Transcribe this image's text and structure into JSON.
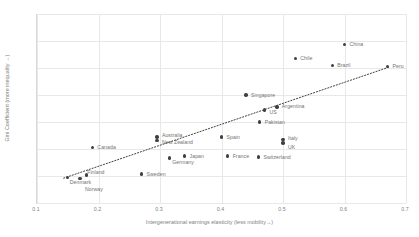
{
  "chart_data": {
    "type": "scatter",
    "title": "",
    "xlabel": "Intergenerational earnings elasticity (less mobility→)",
    "ylabel": "Gini Coefficient (more inequality →)",
    "xlim": [
      0.1,
      0.7
    ],
    "ylim": [
      0.2,
      0.55
    ],
    "xticks": [
      "0.1",
      "0.2",
      "0.3",
      "0.4",
      "0.5",
      "0.6",
      "0.7"
    ],
    "yticks": [
      "0.2",
      "0.25",
      "0.3",
      "0.35",
      "0.4",
      "0.45",
      "0.5",
      "0.55"
    ],
    "grid": true,
    "legend": "none",
    "point_color": "#404040",
    "trendline": {
      "style": "dotted",
      "color": "#404040",
      "x0": 0.145,
      "y0": 0.246,
      "x1": 0.675,
      "y1": 0.452
    },
    "points": [
      {
        "label": "Denmark",
        "x": 0.15,
        "y": 0.247,
        "label_dx": 2,
        "label_dy": 1
      },
      {
        "label": "Norway",
        "x": 0.17,
        "y": 0.245,
        "label_dx": 5,
        "label_dy": 7
      },
      {
        "label": "Finland",
        "x": 0.18,
        "y": 0.252,
        "label_dx": 1,
        "label_dy": -6
      },
      {
        "label": "Canada",
        "x": 0.19,
        "y": 0.303,
        "label_dx": 5,
        "label_dy": -3
      },
      {
        "label": "Sweden",
        "x": 0.27,
        "y": 0.254,
        "label_dx": 5,
        "label_dy": -3
      },
      {
        "label": "Australia",
        "x": 0.295,
        "y": 0.322,
        "label_dx": 5,
        "label_dy": -5
      },
      {
        "label": "New Zealand",
        "x": 0.295,
        "y": 0.316,
        "label_dx": 5,
        "label_dy": -1
      },
      {
        "label": "Germany",
        "x": 0.315,
        "y": 0.283,
        "label_dx": 3,
        "label_dy": 1
      },
      {
        "label": "Japan",
        "x": 0.34,
        "y": 0.287,
        "label_dx": 5,
        "label_dy": -3
      },
      {
        "label": "Spain",
        "x": 0.4,
        "y": 0.322,
        "label_dx": 5,
        "label_dy": -3
      },
      {
        "label": "France",
        "x": 0.41,
        "y": 0.287,
        "label_dx": 5,
        "label_dy": -3
      },
      {
        "label": "Switzerland",
        "x": 0.46,
        "y": 0.285,
        "label_dx": 5,
        "label_dy": -3
      },
      {
        "label": "Singapore",
        "x": 0.44,
        "y": 0.4,
        "label_dx": 5,
        "label_dy": -3
      },
      {
        "label": "US",
        "x": 0.47,
        "y": 0.372,
        "label_dx": 5,
        "label_dy": -1
      },
      {
        "label": "Argentina",
        "x": 0.49,
        "y": 0.378,
        "label_dx": 5,
        "label_dy": -4
      },
      {
        "label": "Pakistan",
        "x": 0.462,
        "y": 0.35,
        "label_dx": 5,
        "label_dy": -3
      },
      {
        "label": "Italy",
        "x": 0.5,
        "y": 0.318,
        "label_dx": 5,
        "label_dy": -4
      },
      {
        "label": "UK",
        "x": 0.5,
        "y": 0.311,
        "label_dx": 5,
        "label_dy": 1
      },
      {
        "label": "Chile",
        "x": 0.52,
        "y": 0.468,
        "label_dx": 5,
        "label_dy": -3
      },
      {
        "label": "Brazil",
        "x": 0.58,
        "y": 0.455,
        "label_dx": 5,
        "label_dy": -3
      },
      {
        "label": "China",
        "x": 0.6,
        "y": 0.494,
        "label_dx": 5,
        "label_dy": -3
      },
      {
        "label": "Peru",
        "x": 0.67,
        "y": 0.453,
        "label_dx": 5,
        "label_dy": -3
      }
    ]
  }
}
